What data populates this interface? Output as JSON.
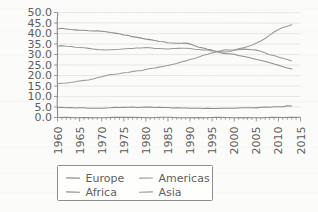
{
  "chart_data": {
    "type": "line",
    "title": "",
    "xlabel": "",
    "ylabel": "",
    "xlim": [
      1960,
      2015
    ],
    "ylim": [
      0.0,
      50.0
    ],
    "grid": true,
    "legend_position": "below-plot",
    "y_ticks": [
      "0.0",
      "5.0",
      "10.0",
      "15.0",
      "20.0",
      "25.0",
      "30.0",
      "35.0",
      "40.0",
      "45.0",
      "50.0"
    ],
    "y_tick_values": [
      0,
      5,
      10,
      15,
      20,
      25,
      30,
      35,
      40,
      45,
      50
    ],
    "x_ticks": [
      "1960",
      "1965",
      "1970",
      "1975",
      "1980",
      "1985",
      "1990",
      "1995",
      "2000",
      "2005",
      "2010",
      "2015"
    ],
    "x_tick_values": [
      1960,
      1965,
      1970,
      1975,
      1980,
      1985,
      1990,
      1995,
      2000,
      2005,
      2010,
      2015
    ],
    "x": [
      1960,
      1961,
      1962,
      1963,
      1964,
      1965,
      1966,
      1967,
      1968,
      1969,
      1970,
      1971,
      1972,
      1973,
      1974,
      1975,
      1976,
      1977,
      1978,
      1979,
      1980,
      1981,
      1982,
      1983,
      1984,
      1985,
      1986,
      1987,
      1988,
      1989,
      1990,
      1991,
      1992,
      1993,
      1994,
      1995,
      1996,
      1997,
      1998,
      1999,
      2000,
      2001,
      2002,
      2003,
      2004,
      2005,
      2006,
      2007,
      2008,
      2009,
      2010,
      2011,
      2012,
      2013
    ],
    "series": [
      {
        "name": "Europe",
        "color": "#8d8d8d",
        "values": [
          42.2,
          42.5,
          42.3,
          42.0,
          41.8,
          41.6,
          41.5,
          41.4,
          41.3,
          41.2,
          41.1,
          40.8,
          40.5,
          40.2,
          39.8,
          39.4,
          39.0,
          38.6,
          38.2,
          37.8,
          37.4,
          37.0,
          36.6,
          36.3,
          36.0,
          35.7,
          35.5,
          35.4,
          35.5,
          35.3,
          35.0,
          34.3,
          33.6,
          33.0,
          32.5,
          32.0,
          31.4,
          30.8,
          30.4,
          30.2,
          30.0,
          29.6,
          29.2,
          28.8,
          28.3,
          27.8,
          27.2,
          26.6,
          26.0,
          25.4,
          24.8,
          24.2,
          23.6,
          23.1
        ]
      },
      {
        "name": "Americas",
        "color": "#9a9a9a",
        "values": [
          34.0,
          34.1,
          34.0,
          33.8,
          33.6,
          33.4,
          33.2,
          33.0,
          32.7,
          32.4,
          32.2,
          32.3,
          32.4,
          32.5,
          32.6,
          32.7,
          32.8,
          32.9,
          33.0,
          33.1,
          33.2,
          33.1,
          33.0,
          32.9,
          32.8,
          32.8,
          32.9,
          32.9,
          32.9,
          32.9,
          32.8,
          32.6,
          32.4,
          32.2,
          32.0,
          31.8,
          31.6,
          31.4,
          31.3,
          31.5,
          32.0,
          32.4,
          32.5,
          32.4,
          32.3,
          32.2,
          31.6,
          30.8,
          30.0,
          29.4,
          28.8,
          28.2,
          27.6,
          27.1
        ]
      },
      {
        "name": "Africa",
        "color": "#8d8d8d",
        "values": [
          4.8,
          4.8,
          4.7,
          4.7,
          4.6,
          4.6,
          4.5,
          4.5,
          4.5,
          4.5,
          4.5,
          4.5,
          4.6,
          4.7,
          4.7,
          4.8,
          4.8,
          4.9,
          4.9,
          4.9,
          5.0,
          4.9,
          4.9,
          4.8,
          4.8,
          4.7,
          4.6,
          4.6,
          4.5,
          4.5,
          4.5,
          4.4,
          4.4,
          4.4,
          4.4,
          4.4,
          4.4,
          4.4,
          4.4,
          4.4,
          4.4,
          4.5,
          4.5,
          4.6,
          4.6,
          4.7,
          4.8,
          4.9,
          5.0,
          5.1,
          5.2,
          5.3,
          5.4,
          5.5
        ]
      },
      {
        "name": "Asia",
        "color": "#9a9a9a",
        "values": [
          16.0,
          16.2,
          16.5,
          16.8,
          17.1,
          17.4,
          17.7,
          18.0,
          18.4,
          18.8,
          19.3,
          20.1,
          20.4,
          20.6,
          20.9,
          21.2,
          21.5,
          21.8,
          22.1,
          22.4,
          22.8,
          23.2,
          23.6,
          24.0,
          24.4,
          24.8,
          25.3,
          25.8,
          26.3,
          26.9,
          27.5,
          28.2,
          28.9,
          29.5,
          30.1,
          30.7,
          31.2,
          31.8,
          32.2,
          32.3,
          32.3,
          32.6,
          33.1,
          33.8,
          34.6,
          35.4,
          36.5,
          37.8,
          39.2,
          40.6,
          41.9,
          42.7,
          43.5,
          44.3
        ]
      }
    ],
    "legend": [
      {
        "label": "Europe",
        "color": "#8d8d8d"
      },
      {
        "label": "Americas",
        "color": "#9a9a9a"
      },
      {
        "label": "Africa",
        "color": "#8d8d8d"
      },
      {
        "label": "Asia",
        "color": "#9a9a9a"
      }
    ]
  }
}
